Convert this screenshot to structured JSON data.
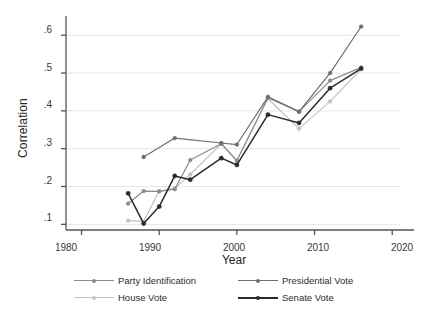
{
  "chart_data": {
    "type": "line",
    "title": "",
    "xlabel": "Year",
    "ylabel": "Correlation",
    "xlim": [
      1978,
      2021
    ],
    "ylim": [
      0.085,
      0.635
    ],
    "xticks": [
      1980,
      1990,
      2000,
      2010,
      2020
    ],
    "xticklabels": [
      "1980",
      "1990",
      "2000",
      "2010",
      "2020"
    ],
    "yticks": [
      0.1,
      0.2,
      0.3,
      0.4,
      0.5,
      0.6
    ],
    "yticklabels": [
      ".1",
      ".2",
      ".3",
      ".4",
      ".5",
      ".6"
    ],
    "grid": "horizontal",
    "legend_position": "bottom",
    "series": [
      {
        "name": "Party Identification",
        "color": "#8c8c8c",
        "x": [
          1986,
          1988,
          1990,
          1992,
          1994,
          1998,
          2000,
          2004,
          2008,
          2012,
          2016
        ],
        "values": [
          0.155,
          0.188,
          0.187,
          0.193,
          0.27,
          0.313,
          0.268,
          0.435,
          0.398,
          0.48,
          0.515
        ]
      },
      {
        "name": "Presidential Vote",
        "color": "#6e6e6e",
        "x": [
          1988,
          1992,
          1998,
          2000,
          2004,
          2008,
          2012,
          2016
        ],
        "values": [
          0.278,
          0.328,
          0.315,
          0.311,
          0.437,
          0.398,
          0.5,
          0.623
        ]
      },
      {
        "name": "House Vote",
        "color": "#c2c2c2",
        "x": [
          1986,
          1988,
          1990,
          1992,
          1994,
          1998,
          2000,
          2004,
          2008,
          2012,
          2016
        ],
        "values": [
          0.11,
          0.108,
          0.188,
          0.195,
          0.232,
          0.313,
          0.27,
          0.432,
          0.353,
          0.425,
          0.51
        ]
      },
      {
        "name": "Senate Vote",
        "color": "#2b2b2b",
        "x": [
          1986,
          1988,
          1990,
          1992,
          1994,
          1998,
          2000,
          2004,
          2008,
          2012,
          2016
        ],
        "values": [
          0.182,
          0.102,
          0.147,
          0.228,
          0.218,
          0.275,
          0.257,
          0.39,
          0.368,
          0.46,
          0.512
        ]
      }
    ]
  },
  "axes": {
    "ylabel": "Correlation",
    "xlabel": "Year",
    "ytick_labels": [
      ".6",
      ".5",
      ".4",
      ".3",
      ".2",
      ".1"
    ],
    "xtick_labels": [
      "1980",
      "1990",
      "2000",
      "2010",
      "2020"
    ]
  },
  "legend": {
    "entries": [
      {
        "label": "Party Identification",
        "color": "#8c8c8c"
      },
      {
        "label": "Presidential Vote",
        "color": "#6e6e6e"
      },
      {
        "label": "House Vote",
        "color": "#c2c2c2"
      },
      {
        "label": "Senate Vote",
        "color": "#2b2b2b"
      }
    ]
  }
}
